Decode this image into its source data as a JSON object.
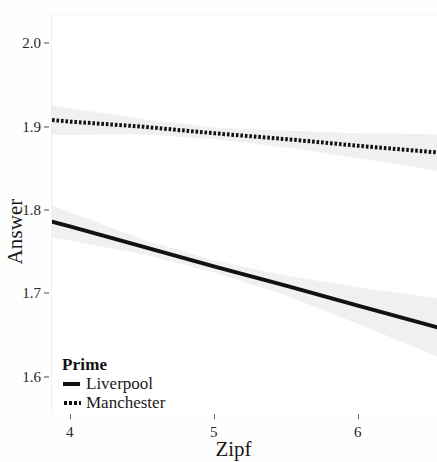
{
  "chart_data": {
    "type": "line",
    "title": "",
    "xlabel": "Zipf",
    "ylabel": "Answer",
    "xlim": [
      3.87,
      6.55
    ],
    "ylim": [
      1.555,
      2.035
    ],
    "xticks": [
      4,
      5,
      6
    ],
    "xtick_labels": [
      "4",
      "5",
      "6"
    ],
    "yticks": [
      1.6,
      1.7,
      1.8,
      1.9,
      2.0
    ],
    "ytick_labels": [
      "1.6",
      "1.7",
      "1.8",
      "1.9",
      "2.0"
    ],
    "grid": false,
    "legend_position": "bottom-left-inside",
    "legend_title": "Prime",
    "series": [
      {
        "name": "Liverpool",
        "linestyle": "solid",
        "color": "#111111",
        "linewidth": 4,
        "x": [
          3.87,
          4.0,
          4.5,
          5.0,
          5.5,
          6.0,
          6.55
        ],
        "y": [
          1.787,
          1.781,
          1.757,
          1.733,
          1.71,
          1.686,
          1.66
        ],
        "ci_upper": [
          1.806,
          1.798,
          1.766,
          1.74,
          1.722,
          1.708,
          1.695
        ],
        "ci_lower": [
          1.768,
          1.764,
          1.748,
          1.726,
          1.698,
          1.664,
          1.625
        ]
      },
      {
        "name": "Manchester",
        "linestyle": "dotted",
        "color": "#111111",
        "linewidth": 4,
        "x": [
          3.87,
          4.0,
          4.5,
          5.0,
          5.5,
          6.0,
          6.55
        ],
        "y": [
          1.909,
          1.907,
          1.901,
          1.893,
          1.886,
          1.878,
          1.87
        ],
        "ci_upper": [
          1.927,
          1.923,
          1.91,
          1.9,
          1.896,
          1.893,
          1.892
        ],
        "ci_lower": [
          1.891,
          1.891,
          1.892,
          1.886,
          1.876,
          1.863,
          1.848
        ]
      }
    ]
  },
  "axes": {
    "y_title": "Answer",
    "x_title": "Zipf"
  },
  "legend": {
    "title": "Prime",
    "entries": [
      {
        "label": "Liverpool",
        "style": "solid"
      },
      {
        "label": "Manchester",
        "style": "dotted"
      }
    ]
  },
  "colors": {
    "line": "#111111",
    "ribbon": "#d9d9d9",
    "text": "#1a1a1a",
    "background": "#fefefe"
  }
}
